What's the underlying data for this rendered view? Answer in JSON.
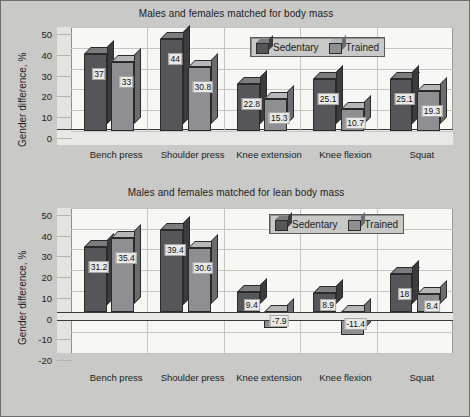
{
  "figure": {
    "background_color": "#c9c9c7",
    "border_color": "#6e6e6c"
  },
  "legend": {
    "position": "top-right inside plot",
    "entries": [
      {
        "label": "Sedentary",
        "color": "#55555a"
      },
      {
        "label": "Trained",
        "color": "#8e8e93"
      }
    ]
  },
  "chart_data": [
    {
      "type": "bar",
      "title": "Males and females matched for body mass",
      "xlabel": "",
      "ylabel": "Gender difference, %",
      "ylim": [
        0,
        50
      ],
      "yticks": [
        0,
        10,
        20,
        30,
        40,
        50
      ],
      "grid": true,
      "legend_position": "upper right",
      "categories": [
        "Bench press",
        "Shoulder press",
        "Knee extension",
        "Knee flexion",
        "Squat"
      ],
      "series": [
        {
          "name": "Sedentary",
          "color": "#55555a",
          "values": [
            37,
            44,
            22.8,
            25.1,
            25.1
          ]
        },
        {
          "name": "Trained",
          "color": "#8e8e93",
          "values": [
            33,
            30.8,
            15.3,
            10.7,
            19.3
          ]
        }
      ],
      "data_labels": [
        [
          "37",
          "44",
          "22.8",
          "25.1",
          "25.1"
        ],
        [
          "33",
          "30.8",
          "15.3",
          "10.7",
          "19.3"
        ]
      ]
    },
    {
      "type": "bar",
      "title": "Males and females matched for lean body mass",
      "xlabel": "",
      "ylabel": "Gender difference, %",
      "ylim": [
        -20,
        50
      ],
      "yticks": [
        -20,
        -10,
        0,
        10,
        20,
        30,
        40,
        50
      ],
      "grid": true,
      "legend_position": "upper right",
      "categories": [
        "Bench press",
        "Shoulder press",
        "Knee extension",
        "Knee flexion",
        "Squat"
      ],
      "series": [
        {
          "name": "Sedentary",
          "color": "#55555a",
          "values": [
            31.2,
            39.4,
            9.4,
            8.9,
            18
          ]
        },
        {
          "name": "Trained",
          "color": "#8e8e93",
          "values": [
            35.4,
            30.6,
            -7.9,
            -11.4,
            8.4
          ]
        }
      ],
      "data_labels": [
        [
          "31.2",
          "39.4",
          "9.4",
          "8.9",
          "18"
        ],
        [
          "35.4",
          "30.6",
          "-7.9",
          "-11.4",
          "8.4"
        ]
      ]
    }
  ]
}
